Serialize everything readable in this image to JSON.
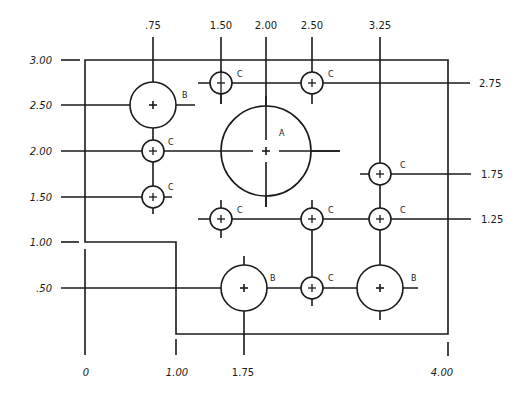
{
  "drawing": {
    "stroke_color": "#1a1a1a",
    "background": "#ffffff",
    "top_dimensions": [
      ".75",
      "1.50",
      "2.00",
      "2.50",
      "3.25"
    ],
    "left_dimensions": [
      "3.00",
      "2.50",
      "2.00",
      "1.50",
      "1.00",
      ".50"
    ],
    "right_dimensions": [
      "2.75",
      "1.75",
      "1.25"
    ],
    "bottom_dimensions": [
      "0",
      "1.00",
      "1.75",
      "4.00"
    ],
    "holes": [
      {
        "label": "B",
        "x": 0.75,
        "y": 2.5,
        "size": "B"
      },
      {
        "label": "C",
        "x": 0.75,
        "y": 2.0,
        "size": "C"
      },
      {
        "label": "C",
        "x": 0.75,
        "y": 1.5,
        "size": "C"
      },
      {
        "label": "C",
        "x": 1.5,
        "y": 2.75,
        "size": "C"
      },
      {
        "label": "C",
        "x": 2.5,
        "y": 2.75,
        "size": "C"
      },
      {
        "label": "A",
        "x": 2.0,
        "y": 2.0,
        "size": "A"
      },
      {
        "label": "C",
        "x": 3.25,
        "y": 1.75,
        "size": "C"
      },
      {
        "label": "C",
        "x": 1.5,
        "y": 1.25,
        "size": "C"
      },
      {
        "label": "C",
        "x": 2.5,
        "y": 1.25,
        "size": "C"
      },
      {
        "label": "C",
        "x": 3.25,
        "y": 1.25,
        "size": "C"
      },
      {
        "label": "B",
        "x": 1.75,
        "y": 0.5,
        "size": "B"
      },
      {
        "label": "C",
        "x": 2.5,
        "y": 0.5,
        "size": "C"
      },
      {
        "label": "B",
        "x": 3.25,
        "y": 0.5,
        "size": "B"
      }
    ]
  },
  "labels": {
    "top": {
      "d075": ".75",
      "d150": "1.50",
      "d200": "2.00",
      "d250": "2.50",
      "d325": "3.25"
    },
    "left": {
      "d300": "3.00",
      "d250": "2.50",
      "d200": "2.00",
      "d150": "1.50",
      "d100": "1.00",
      "d050": ".50"
    },
    "right": {
      "d275": "2.75",
      "d175": "1.75",
      "d125": "1.25"
    },
    "bottom": {
      "d0": "0",
      "d100": "1.00",
      "d175": "1.75",
      "d400": "4.00"
    },
    "holes": {
      "a": "A",
      "b": "B",
      "c": "C"
    }
  }
}
